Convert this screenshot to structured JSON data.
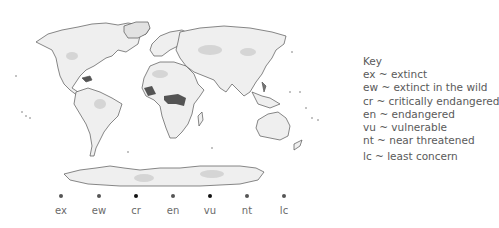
{
  "key": {
    "title": "Key",
    "entries": [
      {
        "code": "ex",
        "label": "ex ~ extinct"
      },
      {
        "code": "ew",
        "label": "ew ~ extinct in the wild"
      },
      {
        "code": "cr",
        "label": "cr ~ critically endangered"
      },
      {
        "code": "en",
        "label": "en ~ endangered"
      },
      {
        "code": "vu",
        "label": "vu ~ vulnerable"
      },
      {
        "code": "nt",
        "label": "nt ~ near threatened"
      },
      {
        "code": "lc",
        "label": "lc ~ least concern"
      }
    ]
  },
  "scale": {
    "items": [
      {
        "label": "ex",
        "color": "#555555"
      },
      {
        "label": "ew",
        "color": "#555555"
      },
      {
        "label": "cr",
        "color": "#111111"
      },
      {
        "label": "en",
        "color": "#555555"
      },
      {
        "label": "vu",
        "color": "#111111"
      },
      {
        "label": "nt",
        "color": "#555555"
      },
      {
        "label": "lc",
        "color": "#555555"
      }
    ]
  },
  "map": {
    "outline_color": "#555555",
    "fill_light": "#eeeeee",
    "fill_mid": "#cfcfcf",
    "fill_dark": "#3a3a3a"
  }
}
